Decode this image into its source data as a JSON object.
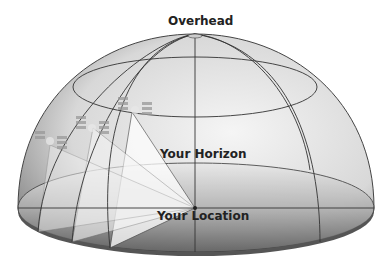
{
  "diagram": {
    "labels": {
      "overhead": "Overhead",
      "horizon": "Your Horizon",
      "location": "Your Location"
    },
    "elements": {
      "dome": "sky-dome",
      "satellites": [
        "satellite-1",
        "satellite-2",
        "satellite-3"
      ]
    },
    "colors": {
      "dome_fill_light": "#f2f2f2",
      "dome_fill_dark": "#8a8a8a",
      "grid_line": "#333333",
      "text": "#222222"
    }
  }
}
